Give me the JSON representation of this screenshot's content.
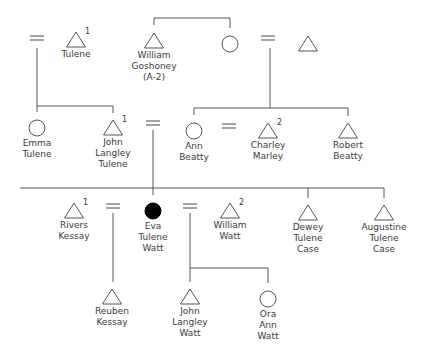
{
  "diagram": {
    "people": {
      "tulene": {
        "sex": "male",
        "name_lines": [
          "Tulene"
        ],
        "marker": "1"
      },
      "emma_tulene": {
        "sex": "female",
        "name_lines": [
          "Emma",
          "Tulene"
        ],
        "marker": ""
      },
      "john_langley_tulene": {
        "sex": "male",
        "name_lines": [
          "John",
          "Langley",
          "Tulene"
        ],
        "marker": "1"
      },
      "william_goshoney": {
        "sex": "male",
        "name_lines": [
          "William",
          "Goshoney",
          "(A-2)"
        ],
        "marker": ""
      },
      "goshoney_sister": {
        "sex": "female",
        "name_lines": [],
        "marker": ""
      },
      "beatty_father": {
        "sex": "male",
        "name_lines": [],
        "marker": ""
      },
      "ann_beatty": {
        "sex": "female",
        "name_lines": [
          "Ann",
          "Beatty"
        ],
        "marker": ""
      },
      "charley_marley": {
        "sex": "male",
        "name_lines": [
          "Charley",
          "Marley"
        ],
        "marker": "2"
      },
      "robert_beatty": {
        "sex": "male",
        "name_lines": [
          "Robert",
          "Beatty"
        ],
        "marker": ""
      },
      "rivers_kessay": {
        "sex": "male",
        "name_lines": [
          "Rivers",
          "Kessay"
        ],
        "marker": "1"
      },
      "eva_tulene_watt": {
        "sex": "female",
        "name_lines": [
          "Eva",
          "Tulene",
          "Watt"
        ],
        "marker": "",
        "ego": true
      },
      "william_watt": {
        "sex": "male",
        "name_lines": [
          "William",
          "Watt"
        ],
        "marker": "2"
      },
      "dewey_tulene_case": {
        "sex": "male",
        "name_lines": [
          "Dewey",
          "Tulene",
          "Case"
        ],
        "marker": ""
      },
      "augustine_tulene_case": {
        "sex": "male",
        "name_lines": [
          "Augustine",
          "Tulene",
          "Case"
        ],
        "marker": ""
      },
      "reuben_kessay": {
        "sex": "male",
        "name_lines": [
          "Reuben",
          "Kessay"
        ],
        "marker": ""
      },
      "john_langley_watt": {
        "sex": "male",
        "name_lines": [
          "John",
          "Langley",
          "Watt"
        ],
        "marker": ""
      },
      "ora_ann_watt": {
        "sex": "female",
        "name_lines": [
          "Ora",
          "Ann",
          "Watt"
        ],
        "marker": ""
      }
    },
    "marriage_symbol": "=",
    "colors": {
      "line": "#555555",
      "text": "#3a3a3a",
      "ego_fill": "#000000",
      "background": "#ffffff"
    }
  }
}
